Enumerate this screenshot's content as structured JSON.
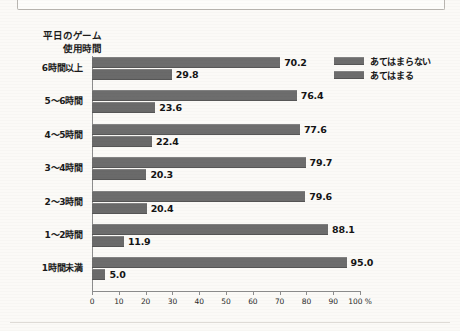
{
  "chart_data": {
    "type": "bar",
    "orientation": "horizontal",
    "title_line1": "平日のゲーム",
    "title_line2": "使用時間",
    "xlabel": "",
    "ylabel": "",
    "xlim": [
      0,
      100
    ],
    "grid": false,
    "legend_position": "top-right",
    "axis_unit": "%",
    "categories": [
      "6時間以上",
      "5～6時間",
      "4～5時間",
      "3～4時間",
      "2～3時間",
      "1～2時間",
      "1時間未満"
    ],
    "tick_labels": [
      "0",
      "10",
      "20",
      "30",
      "40",
      "50",
      "60",
      "70",
      "80",
      "90",
      "100 %"
    ],
    "tick_values": [
      0,
      10,
      20,
      30,
      40,
      50,
      60,
      70,
      80,
      90,
      100
    ],
    "series": [
      {
        "name": "あてはまらない",
        "color": "#6d6d6d",
        "values": [
          70.2,
          76.4,
          77.6,
          79.7,
          79.6,
          88.1,
          95.0
        ],
        "labels": [
          "70.2",
          "76.4",
          "77.6",
          "79.7",
          "79.6",
          "88.1",
          "95.0"
        ]
      },
      {
        "name": "あてはまる",
        "color": "#6a6a6a",
        "values": [
          29.8,
          23.6,
          22.4,
          20.3,
          20.4,
          11.9,
          5.0
        ],
        "labels": [
          "29.8",
          "23.6",
          "22.4",
          "20.3",
          "20.4",
          "11.9",
          "5.0"
        ]
      }
    ]
  },
  "legend": {
    "items": [
      {
        "label": "あてはまらない",
        "color": "#6d6d6d"
      },
      {
        "label": "あてはまる",
        "color": "#6a6a6a"
      }
    ]
  }
}
